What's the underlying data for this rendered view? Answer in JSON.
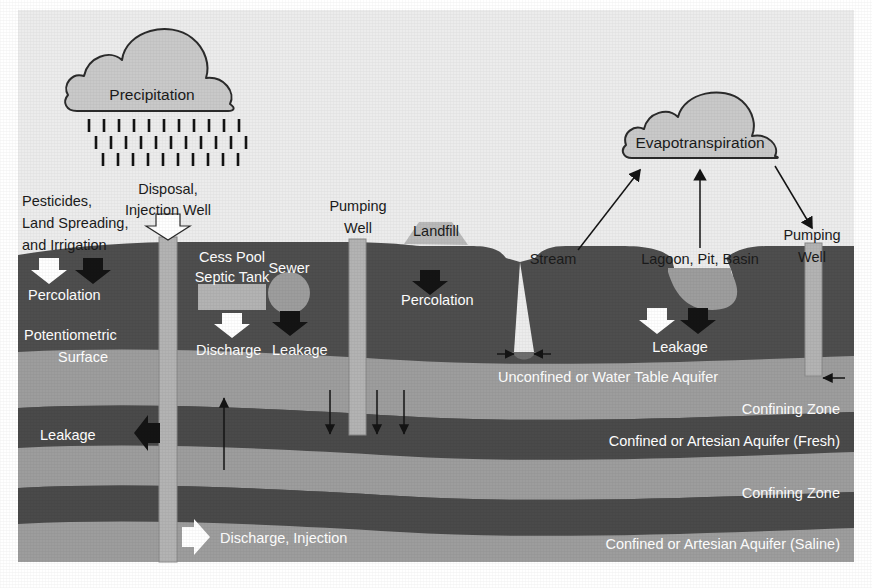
{
  "figure": {
    "canvas": {
      "width": 872,
      "height": 588
    }
  },
  "colors": {
    "page_background": "#ffffff",
    "sky": "#ececec",
    "soil_dark": "#4e4e4e",
    "aquifer_gray": "#9d9d9d",
    "confining_dark": "#4a4a4a",
    "cloud_fill": "#c9c9c9",
    "cloud_stroke": "#2b2b2b",
    "well_casing": "#b3b3b3",
    "landfill_fill": "#b9b9b9",
    "lagoon_water": "#9d9d9d",
    "arrow_white": "#ffffff",
    "arrow_black": "#141414",
    "text_dark": "#1b1b1b",
    "text_light": "#ffffff"
  },
  "clouds": [
    {
      "id": "precipitation",
      "label": "Precipitation"
    },
    {
      "id": "evapotranspiration",
      "label": "Evapotranspiration"
    }
  ],
  "surface_labels": [
    {
      "id": "pesticides",
      "lines": [
        "Pesticides,",
        "Land Spreading,",
        "and Irrigation"
      ]
    },
    {
      "id": "disposal-injection-well",
      "lines": [
        "Disposal,",
        "Injection Well"
      ]
    },
    {
      "id": "pumping-well-center",
      "lines": [
        "Pumping",
        "Well"
      ]
    },
    {
      "id": "landfill",
      "lines": [
        "Landfill"
      ]
    },
    {
      "id": "stream",
      "lines": [
        "Stream"
      ]
    },
    {
      "id": "lagoon-pit-basin",
      "lines": [
        "Lagoon, Pit, Basin"
      ]
    },
    {
      "id": "pumping-well-right",
      "lines": [
        "Pumping",
        "Well"
      ]
    }
  ],
  "subsurface_labels": [
    {
      "id": "percolation-left",
      "text": "Percolation"
    },
    {
      "id": "potentiometric-surface",
      "lines": [
        "Potentiometric",
        "Surface"
      ]
    },
    {
      "id": "cess-pool-septic-tank",
      "lines": [
        "Cess Pool",
        "Septic Tank"
      ]
    },
    {
      "id": "sewer",
      "text": "Sewer"
    },
    {
      "id": "discharge",
      "text": "Discharge"
    },
    {
      "id": "leakage-septic",
      "text": "Leakage"
    },
    {
      "id": "percolation-landfill",
      "text": "Percolation"
    },
    {
      "id": "leakage-lagoon",
      "text": "Leakage"
    },
    {
      "id": "leakage-left",
      "text": "Leakage"
    },
    {
      "id": "discharge-injection",
      "text": "Discharge, Injection"
    }
  ],
  "strata": [
    {
      "id": "unconfined-aquifer",
      "label": "Unconfined or Water Table Aquifer",
      "kind": "aquifer"
    },
    {
      "id": "confining-zone-upper",
      "label": "Confining Zone",
      "kind": "confining"
    },
    {
      "id": "confined-aquifer-fresh",
      "label": "Confined or Artesian Aquifer (Fresh)",
      "kind": "aquifer"
    },
    {
      "id": "confining-zone-lower",
      "label": "Confining Zone",
      "kind": "confining"
    },
    {
      "id": "confined-aquifer-saline",
      "label": "Confined or Artesian Aquifer (Saline)",
      "kind": "aquifer"
    }
  ],
  "icons": {
    "cloud": "cloud-icon",
    "rain": "rain-icon",
    "arrow_white_down": "white-down-arrow-icon",
    "arrow_black_down": "black-down-arrow-icon",
    "arrow_white_right": "white-right-arrow-icon",
    "arrow_black_left": "black-left-arrow-icon",
    "arrow_thin_up": "thin-up-arrow-icon",
    "arrow_thin_down": "thin-down-arrow-icon",
    "well": "well-casing-icon",
    "septic_tank": "septic-tank-icon",
    "sewer_pipe": "sewer-pipe-icon",
    "landfill_mound": "landfill-mound-icon"
  },
  "rain": {
    "rows": 3,
    "ticks_per_row": 11
  }
}
